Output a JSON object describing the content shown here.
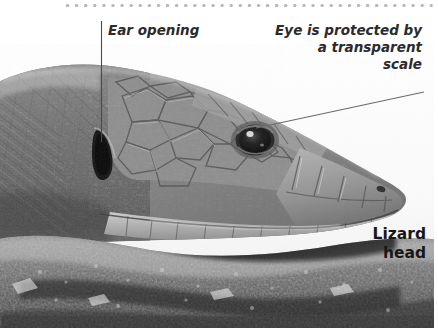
{
  "figure": {
    "title": "Lizard\nhead",
    "decoration": {
      "top_rule": "dotted-rule",
      "rule_color": "#b9b9b9"
    },
    "annotations": [
      {
        "id": "ear-opening",
        "text": "Ear opening",
        "align": "left",
        "leader": "vertical"
      },
      {
        "id": "transparent-scale",
        "text": "Eye is protected by\na transparent\nscale",
        "align": "right",
        "leader": "diagonal"
      }
    ],
    "colors": {
      "text": "#2b2b2b",
      "title": "#181818",
      "leader_line": "#5a5a5a",
      "background": "#ffffff"
    }
  }
}
